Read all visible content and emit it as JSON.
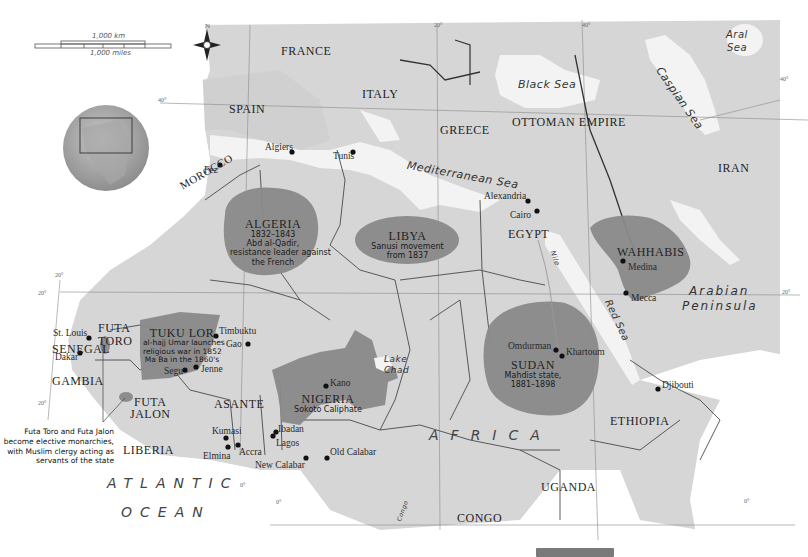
{
  "scale": {
    "km_label": "1,000 km",
    "miles_label": "1,000 miles"
  },
  "compass": {
    "north_label": "N"
  },
  "graticule": {
    "lat_40": "40°",
    "lat_20_a": "20°",
    "lat_20_b": "20°",
    "lat_20_c": "20°",
    "lat_20_right": "20°",
    "lon_20": "20°",
    "lon_40": "40°",
    "lat_40_right": "40°",
    "equator_left": "0°",
    "equator_right": "0°",
    "meridian_0": "0°"
  },
  "countries": {
    "france": "FRANCE",
    "spain": "SPAIN",
    "italy": "ITALY",
    "greece": "GREECE",
    "ottoman": "OTTOMAN EMPIRE",
    "iran": "IRAN",
    "morocco": "MOROCCO",
    "egypt": "EGYPT",
    "ethiopia": "ETHIOPIA",
    "uganda": "UGANDA",
    "congo": "CONGO",
    "liberia": "LIBERIA",
    "asante": "ASANTE",
    "gambia": "GAMBIA",
    "senegal": "SENEGAL",
    "futa_toro": [
      "FUTA",
      "TORO"
    ],
    "futa_jalon": [
      "FUTA",
      "JALON"
    ]
  },
  "water": {
    "black_sea": "Black Sea",
    "mediterranean": "Mediterranean Sea",
    "caspian": "Caspian Sea",
    "aral": [
      "Aral",
      "Sea"
    ],
    "red_sea": "Red Sea",
    "nile": "Nile",
    "lake_chad": [
      "Lake",
      "Chad"
    ],
    "congo_river": "Congo",
    "atlantic": [
      "ATLANTIC",
      "OCEAN"
    ]
  },
  "regions": {
    "africa": "AFRICA",
    "arabian_peninsula": [
      "Arabian",
      "Peninsula"
    ]
  },
  "movements": [
    {
      "id": "algeria",
      "title": "ALGERIA",
      "lines": [
        "1832–1843",
        "Abd al-Qadir,",
        "resistance leader against",
        "the French"
      ]
    },
    {
      "id": "libya",
      "title": "LIBYA",
      "lines": [
        "Sanusi movement",
        "from 1837"
      ]
    },
    {
      "id": "wahhabis",
      "title": "WAHHABIS",
      "lines": []
    },
    {
      "id": "sudan",
      "title": "SUDAN",
      "lines": [
        "Mahdist state,",
        "1881–1898"
      ]
    },
    {
      "id": "nigeria",
      "title": "NIGERIA",
      "lines": [
        "Sokoto Caliphate"
      ]
    },
    {
      "id": "tukulor",
      "title": "TUKU LOR",
      "lines": [
        "al-hajj Umar launches",
        "religious war in 1852",
        "Ma Ba in the 1860's"
      ]
    }
  ],
  "cities": {
    "fez": "Fez",
    "algiers": "Algiers",
    "tunis": "Tunis",
    "alexandria": "Alexandria",
    "cairo": "Cairo",
    "medina": "Medina",
    "mecca": "Mecca",
    "omdurman": "Omdurman",
    "khartoum": "Khartoum",
    "djibouti": "Djibouti",
    "timbuktu": "Timbuktu",
    "gao": "Gao",
    "segu": "Segu",
    "jenne": "Jenne",
    "kano": "Kano",
    "st_louis": "St. Louis",
    "dakar": "Dakar",
    "kumasi": "Kumasi",
    "elmina": "Elmina",
    "accra": "Accra",
    "ibadan": "Ibadan",
    "lagos": "Lagos",
    "new_calabar": "New Calabar",
    "old_calabar": "Old Calabar"
  },
  "annotation": {
    "futa_note": [
      "Futa Toro and Futa Jalon",
      "become elective monarchies,",
      "with Muslim clergy acting as",
      "servants of the state"
    ]
  },
  "colors": {
    "land": "#d4d4d4",
    "land_dark": "#bcbcbc",
    "water": "#f0f0f0",
    "ocean_fade": "#ffffff",
    "movement_fill": "#8a8a8a",
    "border": "#555555",
    "city_dot": "#111111"
  }
}
